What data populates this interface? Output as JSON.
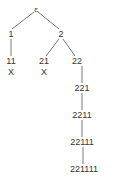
{
  "diagram": {
    "type": "tree",
    "nodes": [
      {
        "id": "root",
        "label": "ε",
        "x": 36,
        "y": 9
      },
      {
        "id": "n1",
        "label": "1",
        "x": 11,
        "y": 34
      },
      {
        "id": "n2",
        "label": "2",
        "x": 61,
        "y": 34
      },
      {
        "id": "n11",
        "label": "11",
        "x": 11,
        "y": 61
      },
      {
        "id": "n11x",
        "label": "X",
        "x": 11,
        "y": 72
      },
      {
        "id": "n21",
        "label": "21",
        "x": 44,
        "y": 61
      },
      {
        "id": "n21x",
        "label": "X",
        "x": 44,
        "y": 72
      },
      {
        "id": "n22",
        "label": "22",
        "x": 77,
        "y": 61
      },
      {
        "id": "n221",
        "label": "221",
        "x": 82,
        "y": 88
      },
      {
        "id": "n2211",
        "label": "2211",
        "x": 82,
        "y": 115
      },
      {
        "id": "n22111",
        "label": "22111",
        "x": 82,
        "y": 142
      },
      {
        "id": "n221111",
        "label": "221111",
        "x": 84,
        "y": 169
      }
    ],
    "edges": [
      [
        "root",
        "n1"
      ],
      [
        "root",
        "n2"
      ],
      [
        "n1",
        "n11"
      ],
      [
        "n2",
        "n21"
      ],
      [
        "n2",
        "n22"
      ],
      [
        "n22",
        "n221"
      ],
      [
        "n221",
        "n2211"
      ],
      [
        "n2211",
        "n22111"
      ],
      [
        "n22111",
        "n221111"
      ]
    ],
    "line_color": "#555555"
  }
}
